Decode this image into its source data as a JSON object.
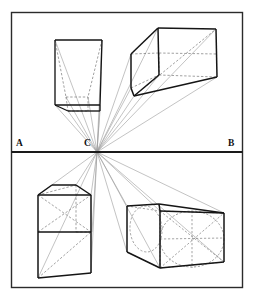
{
  "figure": {
    "type": "perspective-diagram",
    "canvas": {
      "width": 261,
      "height": 304,
      "background": "#ffffff"
    },
    "frame": {
      "name": "plate-border",
      "x": 11.5,
      "y": 12.5,
      "width": 231,
      "height": 275,
      "stroke": "#2b2b2b",
      "stroke_width": 1.4,
      "fill": "#ffffff"
    },
    "horizon": {
      "name": "horizon-line",
      "label_left": "A",
      "label_center": "C",
      "label_right": "B",
      "y": 152,
      "x_start": 11.5,
      "x_end": 242.5,
      "stroke": "#1a1a1a",
      "stroke_width": 2.0
    },
    "vanishing_point": {
      "label": "C",
      "x": 97,
      "y": 152
    },
    "colors": {
      "ink": "#1a1a1a",
      "solid_edge": "#151515",
      "hidden_edge": "#6e6e6e",
      "ray": "#8a8a8a",
      "border": "#2b2b2b",
      "paper": "#ffffff"
    },
    "objects": [
      {
        "name": "upper-left-frustum",
        "note": "box above horizon seen from below, front face square, rear face converging to C"
      },
      {
        "name": "upper-right-cube",
        "note": "cube above and right of horizon with hidden rear edges dashed"
      },
      {
        "name": "lower-left-tall-box",
        "note": "tall box below horizon, divided by a horizontal edge, receding to C"
      },
      {
        "name": "lower-right-cylinder-box",
        "note": "box below right of horizon containing an inscribed cylinder / circle"
      }
    ],
    "rays": {
      "name": "convergence-rays",
      "count": 22,
      "note": "construction lines radiating from vanishing point C to object corners"
    }
  }
}
